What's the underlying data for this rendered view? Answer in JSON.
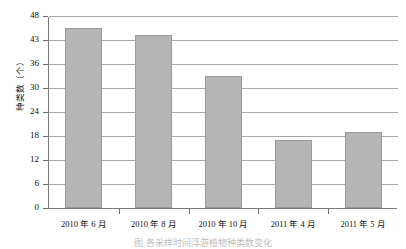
{
  "chart_data": {
    "type": "bar",
    "title": "",
    "xlabel": "",
    "ylabel": "种类数（个）",
    "categories": [
      "2010 年 6 月",
      "2010 年 8 月",
      "2010 年 10 月",
      "2011 年 4 月",
      "2011 年 5 月"
    ],
    "values": [
      45.5,
      44,
      33,
      17,
      19
    ],
    "ylim": [
      0,
      48
    ],
    "yticks": [
      0,
      6,
      12,
      18,
      24,
      30,
      36,
      43,
      48
    ],
    "ytick_labels": [
      "0",
      "6",
      "12",
      "18",
      "24",
      "30",
      "36",
      "43",
      "48"
    ],
    "grid": "horizontal",
    "legend": "none",
    "series": [
      {
        "name": "种类数",
        "values": [
          45.5,
          44,
          33,
          17,
          19
        ],
        "color": "#b5b5b5"
      }
    ]
  },
  "figure": {
    "caption": "图  各采样时间浮游植物种类数变化",
    "bar_color": "#b5b5b5",
    "bar_border_color": "#9b9b9b",
    "gridline_color": "#a9a9a9",
    "axis_color": "#7a7a7a"
  }
}
